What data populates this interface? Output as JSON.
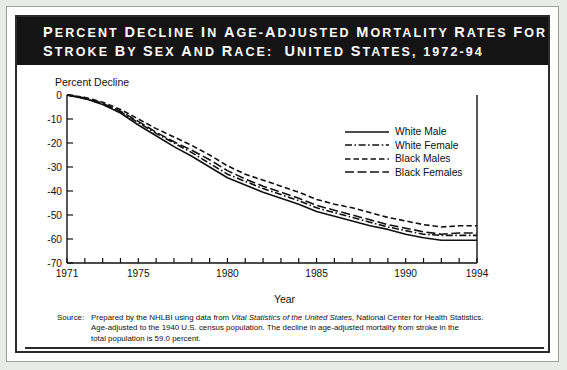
{
  "header": {
    "title_line1": "PERCENT DECLINE IN AGE-ADJUSTED MORTALITY RATES FOR",
    "title_line2": "STROKE BY SEX AND RACE:  UNITED STATES, 1972-94",
    "background_color": "#141414",
    "text_color": "#ffffff"
  },
  "source": {
    "label": "Source:",
    "line1_pre": "Prepared by the NHLBI using data from ",
    "line1_italic": "Vital Statistics of the United States",
    "line1_post": ", National Center for Health Statistics.",
    "line2": "Age-adjusted to the 1940 U.S. census population.  The decline in age-adjusted mortality from stroke in the",
    "line3": "total population is 59.0 percent."
  },
  "chart_data": {
    "type": "line",
    "title": "Percent Decline in Age-Adjusted Mortality Rates for Stroke by Sex and Race: United States, 1972-94",
    "xlabel": "Year",
    "ylabel": "Percent Decline",
    "xlim": [
      1971,
      1994
    ],
    "ylim": [
      -70,
      0
    ],
    "yticks": [
      0,
      -10,
      -20,
      -30,
      -40,
      -50,
      -60,
      -70
    ],
    "ytick_labels": [
      "0",
      "-10",
      "-20",
      "-30",
      "-40",
      "-50",
      "-60",
      "-70"
    ],
    "xticks": [
      1971,
      1972,
      1973,
      1974,
      1975,
      1976,
      1977,
      1978,
      1979,
      1980,
      1981,
      1982,
      1983,
      1984,
      1985,
      1986,
      1987,
      1988,
      1989,
      1990,
      1991,
      1992,
      1993,
      1994
    ],
    "xtick_labels_shown": [
      "1971",
      "1975",
      "1980",
      "1985",
      "1990",
      "1994"
    ],
    "xtick_labels_shown_at": [
      1971,
      1975,
      1980,
      1985,
      1990,
      1994
    ],
    "grid": false,
    "legend_position": "upper right",
    "x": [
      1971,
      1972,
      1973,
      1974,
      1975,
      1976,
      1977,
      1978,
      1979,
      1980,
      1981,
      1982,
      1983,
      1984,
      1985,
      1986,
      1987,
      1988,
      1989,
      1990,
      1991,
      1992,
      1993,
      1994
    ],
    "series": [
      {
        "name": "White Male",
        "line_style": "solid",
        "color": "#111111",
        "values": [
          0,
          -1.5,
          -4.0,
          -7.5,
          -12.5,
          -17.0,
          -21.5,
          -25.5,
          -30.0,
          -34.5,
          -37.5,
          -40.5,
          -43.0,
          -45.5,
          -48.5,
          -50.5,
          -52.5,
          -54.5,
          -56.0,
          -58.0,
          -59.5,
          -60.5,
          -60.5,
          -60.5
        ]
      },
      {
        "name": "White Female",
        "line_style": "dashdot",
        "color": "#111111",
        "values": [
          0,
          -1.5,
          -3.5,
          -7.0,
          -11.5,
          -16.0,
          -20.0,
          -24.0,
          -28.5,
          -33.0,
          -36.0,
          -39.0,
          -41.5,
          -44.0,
          -47.0,
          -49.0,
          -51.0,
          -53.0,
          -55.0,
          -56.5,
          -58.0,
          -58.5,
          -58.5,
          -58.5
        ]
      },
      {
        "name": "Black Males",
        "line_style": "dashed-short",
        "color": "#111111",
        "values": [
          0,
          -1.0,
          -3.0,
          -6.0,
          -10.0,
          -14.0,
          -17.5,
          -21.0,
          -25.0,
          -29.5,
          -33.0,
          -35.5,
          -38.0,
          -40.5,
          -43.5,
          -45.5,
          -47.0,
          -49.0,
          -51.0,
          -52.5,
          -54.0,
          -55.0,
          -54.5,
          -54.5
        ]
      },
      {
        "name": "Black Females",
        "line_style": "dashed-long",
        "color": "#111111",
        "values": [
          0,
          -1.2,
          -3.5,
          -6.8,
          -11.0,
          -15.5,
          -19.5,
          -23.0,
          -27.0,
          -31.5,
          -35.0,
          -38.0,
          -40.5,
          -43.0,
          -46.0,
          -48.0,
          -50.0,
          -52.0,
          -54.0,
          -55.5,
          -57.0,
          -58.0,
          -57.5,
          -57.5
        ]
      }
    ]
  }
}
